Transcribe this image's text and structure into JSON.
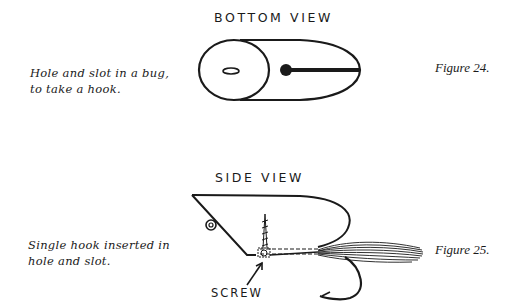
{
  "figure24": {
    "title": "BOTTOM VIEW",
    "caption_line1": "Hole and slot in a bug,",
    "caption_line2": "to take a hook.",
    "label": "Figure 24."
  },
  "figure25": {
    "title": "SIDE VIEW",
    "caption_line1": "Single hook inserted in",
    "caption_line2": "hole and slot.",
    "label": "Figure 25.",
    "callout": "SCREW"
  },
  "colors": {
    "ink": "#1a1a1a",
    "paper": "#ffffff"
  }
}
